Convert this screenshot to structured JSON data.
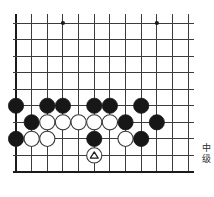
{
  "page": {
    "background_color": "#ffffff",
    "width": 214,
    "height": 197
  },
  "board": {
    "type": "go-board-diagram",
    "description": "Go (Weiqi) problem diagram showing the bottom-left portion of a board",
    "line_color": "#3c3c3c",
    "edge_line_color": "#1a1a1a",
    "black_stone_color": "#171717",
    "white_stone_color": "#ffffff",
    "white_stone_border_color": "#3a3a3a",
    "columns": 12,
    "rows": 10,
    "left_edge_x": 16,
    "top_y": 23,
    "bottom_edge_y": 172,
    "right_x": 188,
    "col_spacing": 15.65,
    "row_spacing": 16.55,
    "bottom_edge_is_board_border": true,
    "left_edge_is_board_border": true,
    "star_points": [
      {
        "col": 4,
        "row": 1,
        "label": "star-point-left"
      },
      {
        "col": 10,
        "row": 1,
        "label": "star-point-right"
      }
    ],
    "stones": [
      {
        "id": "b1",
        "color": "black",
        "col": 1,
        "row": 6
      },
      {
        "id": "b2",
        "color": "black",
        "col": 3,
        "row": 6
      },
      {
        "id": "b3",
        "color": "black",
        "col": 4,
        "row": 6
      },
      {
        "id": "b4",
        "color": "black",
        "col": 6,
        "row": 6
      },
      {
        "id": "b5",
        "color": "black",
        "col": 7,
        "row": 6
      },
      {
        "id": "b6",
        "color": "black",
        "col": 9,
        "row": 6
      },
      {
        "id": "b7",
        "color": "black",
        "col": 2,
        "row": 7
      },
      {
        "id": "w1",
        "color": "white",
        "col": 3,
        "row": 7
      },
      {
        "id": "w2",
        "color": "white",
        "col": 4,
        "row": 7
      },
      {
        "id": "w3",
        "color": "white",
        "col": 5,
        "row": 7
      },
      {
        "id": "w4",
        "color": "white",
        "col": 6,
        "row": 7
      },
      {
        "id": "w5",
        "color": "white",
        "col": 7,
        "row": 7
      },
      {
        "id": "b8",
        "color": "black",
        "col": 8,
        "row": 7
      },
      {
        "id": "b9",
        "color": "black",
        "col": 10,
        "row": 7
      },
      {
        "id": "b10",
        "color": "black",
        "col": 1,
        "row": 8
      },
      {
        "id": "w6",
        "color": "white",
        "col": 2,
        "row": 8
      },
      {
        "id": "w7",
        "color": "white",
        "col": 3,
        "row": 8
      },
      {
        "id": "b11",
        "color": "black",
        "col": 6,
        "row": 8
      },
      {
        "id": "w8",
        "color": "white",
        "col": 8,
        "row": 8
      },
      {
        "id": "b12",
        "color": "black",
        "col": 9,
        "row": 8
      },
      {
        "id": "w9",
        "color": "white",
        "col": 6,
        "row": 9,
        "marker": "triangle",
        "marker_color": "#1a1a1a",
        "note": "marked white stone on the bottom edge line"
      }
    ],
    "stone_radius": 7.6,
    "marker_size": 7
  },
  "caption": {
    "name": "level-label",
    "text_lines": [
      "中",
      "级"
    ],
    "full_text": "中级",
    "orientation": "vertical",
    "color": "#2b2b2b"
  }
}
